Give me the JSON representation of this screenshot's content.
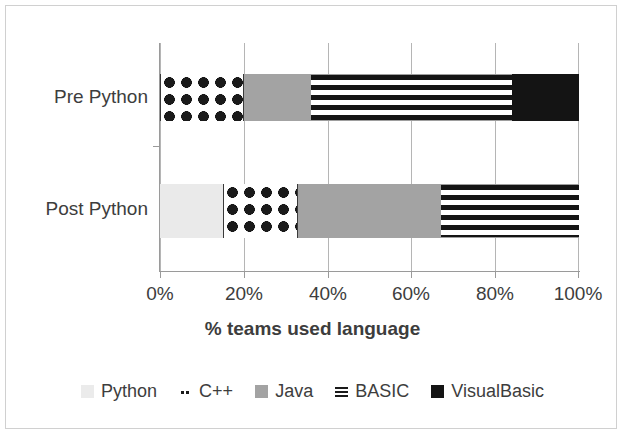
{
  "chart_data": {
    "type": "bar",
    "orientation": "horizontal",
    "stacked": true,
    "normalized": true,
    "title": "",
    "xlabel": "% teams used language",
    "ylabel": "",
    "xlim": [
      0,
      100
    ],
    "categories": [
      "Pre Python",
      "Post Python"
    ],
    "tick_labels": [
      "0%",
      "20%",
      "40%",
      "60%",
      "80%",
      "100%"
    ],
    "tick_values": [
      0,
      20,
      40,
      60,
      80,
      100
    ],
    "grid": true,
    "legend_position": "bottom",
    "series": [
      {
        "name": "Python",
        "values": [
          0,
          15
        ],
        "fill": "solid-light-gray",
        "color": "#eaeaea"
      },
      {
        "name": "C++",
        "values": [
          20,
          18
        ],
        "fill": "diamond-pattern",
        "color": "#1a1a1a"
      },
      {
        "name": "Java",
        "values": [
          16,
          34
        ],
        "fill": "solid-gray",
        "color": "#a3a3a3"
      },
      {
        "name": "BASIC",
        "values": [
          48,
          33
        ],
        "fill": "horizontal-stripes",
        "color": "#141414"
      },
      {
        "name": "VisualBasic",
        "values": [
          16,
          0
        ],
        "fill": "solid-black",
        "color": "#141414"
      }
    ],
    "segments": {
      "pre_python": [
        {
          "series": "Python",
          "start": 0,
          "end": 0,
          "value": 0
        },
        {
          "series": "C++",
          "start": 0,
          "end": 20,
          "value": 20
        },
        {
          "series": "Java",
          "start": 20,
          "end": 36,
          "value": 16
        },
        {
          "series": "BASIC",
          "start": 36,
          "end": 84,
          "value": 48
        },
        {
          "series": "VisualBasic",
          "start": 84,
          "end": 100,
          "value": 16
        }
      ],
      "post_python": [
        {
          "series": "Python",
          "start": 0,
          "end": 15,
          "value": 15
        },
        {
          "series": "C++",
          "start": 15,
          "end": 33,
          "value": 18
        },
        {
          "series": "Java",
          "start": 33,
          "end": 67,
          "value": 34
        },
        {
          "series": "BASIC",
          "start": 67,
          "end": 100,
          "value": 33
        },
        {
          "series": "VisualBasic",
          "start": 100,
          "end": 100,
          "value": 0
        }
      ]
    }
  },
  "axis": {
    "title": "% teams used language",
    "ticks": [
      "0%",
      "20%",
      "40%",
      "60%",
      "80%",
      "100%"
    ]
  },
  "categories": {
    "pre": "Pre Python",
    "post": "Post Python"
  },
  "legend": {
    "items": [
      {
        "label": "Python"
      },
      {
        "label": "C++"
      },
      {
        "label": "Java"
      },
      {
        "label": "BASIC"
      },
      {
        "label": "VisualBasic"
      }
    ]
  }
}
